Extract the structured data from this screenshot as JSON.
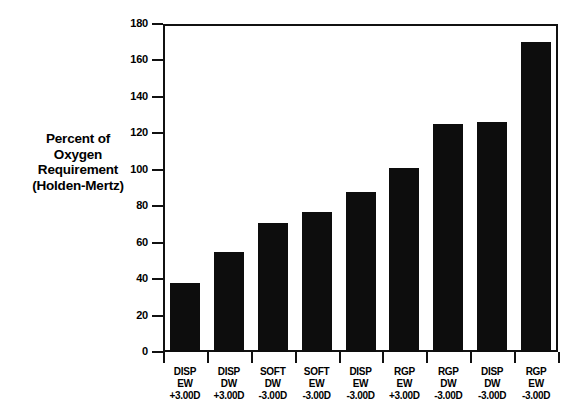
{
  "chart_data": {
    "type": "bar",
    "title": "",
    "xlabel": "",
    "ylabel": "Percent of Oxygen Requirement (Holden-Mertz)",
    "ylabel_lines": [
      "Percent of",
      "Oxygen",
      "Requirement",
      "(Holden-Mertz)"
    ],
    "categories": [
      "DISP EW +3.00D",
      "DISP DW +3.00D",
      "SOFT DW -3.00D",
      "SOFT EW -3.00D",
      "DISP EW -3.00D",
      "RGP EW +3.00D",
      "RGP DW -3.00D",
      "DISP DW -3.00D",
      "RGP EW -3.00D"
    ],
    "category_lines": [
      [
        "DISP",
        "EW",
        "+3.00D"
      ],
      [
        "DISP",
        "DW",
        "+3.00D"
      ],
      [
        "SOFT",
        "DW",
        "-3.00D"
      ],
      [
        "SOFT",
        "EW",
        "-3.00D"
      ],
      [
        "DISP",
        "EW",
        "-3.00D"
      ],
      [
        "RGP",
        "EW",
        "+3.00D"
      ],
      [
        "RGP",
        "DW",
        "-3.00D"
      ],
      [
        "DISP",
        "DW",
        "-3.00D"
      ],
      [
        "RGP",
        "EW",
        "-3.00D"
      ]
    ],
    "values": [
      38,
      55,
      71,
      77,
      88,
      101,
      125,
      126,
      170
    ],
    "ylim": [
      0,
      180
    ],
    "ytick_step": 20,
    "yticks": [
      0,
      20,
      40,
      60,
      80,
      100,
      120,
      140,
      160,
      180
    ],
    "ytick_labels": [
      "0",
      "20",
      "40",
      "60",
      "80",
      "100",
      "120",
      "140",
      "160",
      "180"
    ],
    "grid": false,
    "legend": false,
    "bar_color": "#0d0d0d",
    "axis_color": "#111111",
    "background_color": "#ffffff"
  }
}
